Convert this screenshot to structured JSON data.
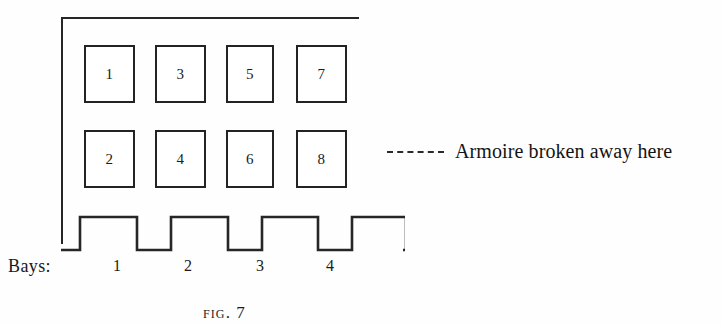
{
  "figure": {
    "caption_prefix": "FIG.",
    "caption_number": "7",
    "caption_full": "FIG. 7"
  },
  "diagram": {
    "kind": "armoire-elevation-schematic",
    "ink_color": "#232323",
    "background_color": "#fefefe",
    "carcase": {
      "top_rail_present": true,
      "left_stile_present": true,
      "right_side_open": true
    },
    "rows": [
      {
        "row_name": "upper-row",
        "compartments": [
          {
            "label": "1",
            "bay": "1"
          },
          {
            "label": "3",
            "bay": "2"
          },
          {
            "label": "5",
            "bay": "3"
          },
          {
            "label": "7",
            "bay": "4"
          }
        ]
      },
      {
        "row_name": "lower-row",
        "compartments": [
          {
            "label": "2",
            "bay": "1"
          },
          {
            "label": "4",
            "bay": "2"
          },
          {
            "label": "6",
            "bay": "3"
          },
          {
            "label": "8",
            "bay": "4"
          }
        ]
      }
    ],
    "plinth": {
      "name": "crenellated-base",
      "merlon_count": "4",
      "profile": "square-wave"
    },
    "bays_axis": {
      "label": "Bays:",
      "ticks": [
        "1",
        "2",
        "3",
        "4"
      ]
    },
    "annotation": {
      "leader_style": "dashed",
      "leader_dash_count": "5",
      "text": "Armoire broken away here"
    }
  }
}
